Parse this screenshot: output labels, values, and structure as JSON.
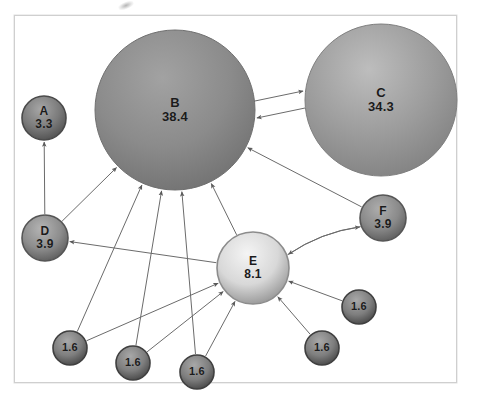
{
  "figure": {
    "type": "node-link-diagram",
    "title": "",
    "background_color": "#ffffff",
    "frame_color": "#cfcfcf",
    "edge_color": "#6b6b6b",
    "label_color": "#1b1b1b"
  },
  "nodes": [
    {
      "id": "A",
      "name": "A",
      "value": "3.3",
      "cx": 44,
      "cy": 118,
      "r": 22,
      "fill": "#7b7b7b",
      "stroke": "#4a4a4a",
      "highlight": "#a6a6a6",
      "label_size": 12
    },
    {
      "id": "B",
      "name": "B",
      "value": "38.4",
      "cx": 175,
      "cy": 110,
      "r": 80,
      "fill": "#8b8b8b",
      "stroke": "#6f6f6f",
      "highlight": "#a2a2a2",
      "label_size": 13
    },
    {
      "id": "C",
      "name": "C",
      "value": "34.3",
      "cx": 381,
      "cy": 100,
      "r": 76,
      "fill": "#9c9c9c",
      "stroke": "#7f7f7f",
      "highlight": "#bdbdbd",
      "label_size": 13
    },
    {
      "id": "D",
      "name": "D",
      "value": "3.9",
      "cx": 45,
      "cy": 238,
      "r": 23,
      "fill": "#8d8d8d",
      "stroke": "#555555",
      "highlight": "#b4b4b4",
      "label_size": 12
    },
    {
      "id": "E",
      "name": "E",
      "value": "8.1",
      "cx": 253,
      "cy": 268,
      "r": 36,
      "fill": "#d8d8d8",
      "stroke": "#8c8c8c",
      "highlight": "#f4f4f4",
      "label_size": 12
    },
    {
      "id": "F",
      "name": "F",
      "value": "3.9",
      "cx": 383,
      "cy": 218,
      "r": 23,
      "fill": "#8a8a8a",
      "stroke": "#565656",
      "highlight": "#adadad",
      "label_size": 12
    },
    {
      "id": "S1",
      "name": "",
      "value": "1.6",
      "cx": 70,
      "cy": 348,
      "r": 17,
      "fill": "#7e7e7e",
      "stroke": "#3f3f3f",
      "highlight": "#a8a8a8",
      "label_size": 11
    },
    {
      "id": "S2",
      "name": "",
      "value": "1.6",
      "cx": 133,
      "cy": 363,
      "r": 17,
      "fill": "#7e7e7e",
      "stroke": "#3f3f3f",
      "highlight": "#a8a8a8",
      "label_size": 11
    },
    {
      "id": "S3",
      "name": "",
      "value": "1.6",
      "cx": 197,
      "cy": 372,
      "r": 17,
      "fill": "#7e7e7e",
      "stroke": "#3f3f3f",
      "highlight": "#a8a8a8",
      "label_size": 11
    },
    {
      "id": "S4",
      "name": "",
      "value": "1.6",
      "cx": 359,
      "cy": 307,
      "r": 17,
      "fill": "#7e7e7e",
      "stroke": "#3f3f3f",
      "highlight": "#a8a8a8",
      "label_size": 11
    },
    {
      "id": "S5",
      "name": "",
      "value": "1.6",
      "cx": 322,
      "cy": 348,
      "r": 17,
      "fill": "#7e7e7e",
      "stroke": "#3f3f3f",
      "highlight": "#a8a8a8",
      "label_size": 11
    }
  ],
  "edges": [
    {
      "from": "D",
      "to": "A",
      "shape": "straight",
      "arrow": "single"
    },
    {
      "from": "D",
      "to": "B",
      "shape": "straight",
      "arrow": "single"
    },
    {
      "from": "B",
      "to": "C",
      "shape": "parallel-top",
      "arrow": "single"
    },
    {
      "from": "C",
      "to": "B",
      "shape": "parallel-bottom",
      "arrow": "single"
    },
    {
      "from": "F",
      "to": "B",
      "shape": "straight",
      "arrow": "single"
    },
    {
      "from": "E",
      "to": "B",
      "shape": "straight",
      "arrow": "single"
    },
    {
      "from": "E",
      "to": "D",
      "shape": "straight",
      "arrow": "single"
    },
    {
      "from": "E",
      "to": "F",
      "shape": "curved",
      "arrow": "single"
    },
    {
      "from": "F",
      "to": "E",
      "shape": "curved",
      "arrow": "single"
    },
    {
      "from": "S1",
      "to": "B",
      "shape": "straight",
      "arrow": "single"
    },
    {
      "from": "S1",
      "to": "E",
      "shape": "straight",
      "arrow": "single"
    },
    {
      "from": "S2",
      "to": "B",
      "shape": "straight",
      "arrow": "single"
    },
    {
      "from": "S2",
      "to": "E",
      "shape": "straight",
      "arrow": "single"
    },
    {
      "from": "S3",
      "to": "B",
      "shape": "straight",
      "arrow": "single"
    },
    {
      "from": "S3",
      "to": "E",
      "shape": "straight",
      "arrow": "single"
    },
    {
      "from": "S4",
      "to": "E",
      "shape": "straight",
      "arrow": "single"
    },
    {
      "from": "S5",
      "to": "E",
      "shape": "straight",
      "arrow": "single"
    }
  ]
}
